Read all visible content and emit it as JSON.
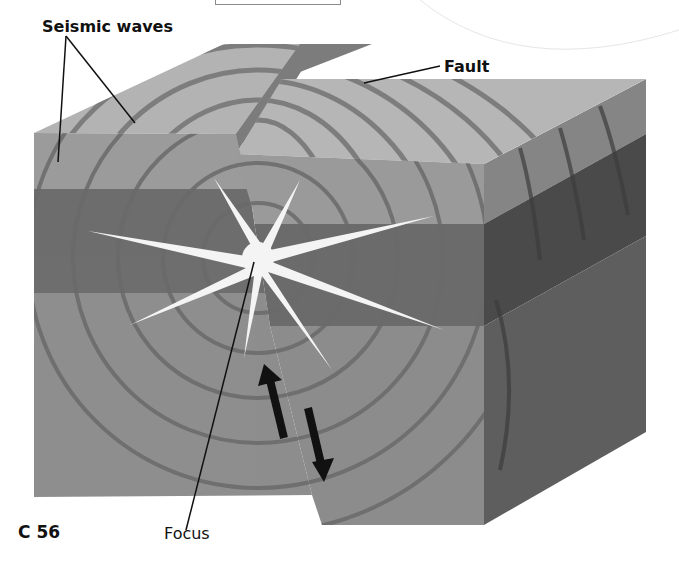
{
  "figure": {
    "type": "block-diagram"
  },
  "labels": {
    "seismic_waves": "Seismic waves",
    "fault": "Fault",
    "focus": "Focus"
  },
  "page": {
    "number": "C 56"
  },
  "colors": {
    "top_light": "#b3b3b3",
    "top_layer_front": "#9c9c9c",
    "dark_band_front": "#6e6e6e",
    "lower_front": "#8e8e8e",
    "right_side_top": "#858585",
    "right_side_dark": "#4a4a4a",
    "right_side_lower": "#5e5e5e",
    "fault_top": "#7c7c7c",
    "wave_line": "#6a6a6a",
    "star": "#f4f4f4",
    "arrow": "#111111"
  },
  "arrows": [
    {
      "direction": "up",
      "side": "left block"
    },
    {
      "direction": "down",
      "side": "right block"
    }
  ]
}
